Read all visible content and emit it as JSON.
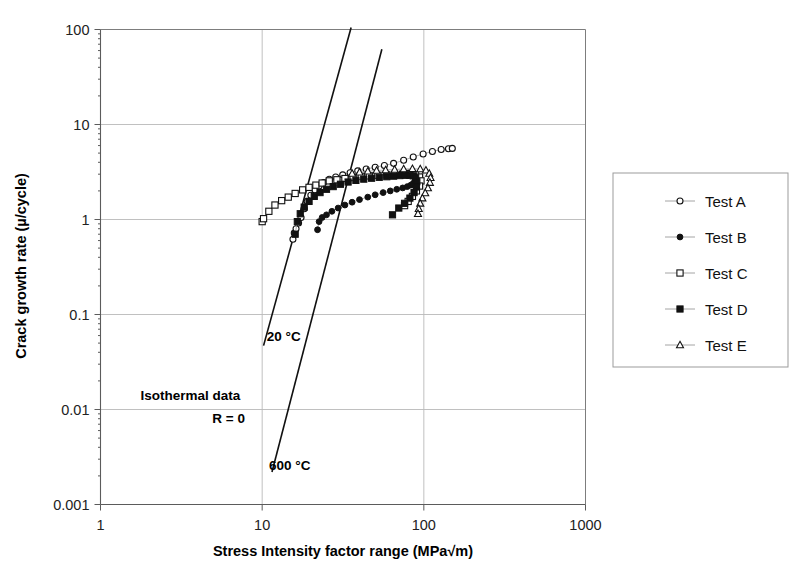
{
  "chart_data": {
    "type": "scatter",
    "title": "",
    "xlabel": "Stress Intensity factor range (MPa√m)",
    "ylabel": "Crack growth rate (µ/cycle)",
    "xscale": "log",
    "yscale": "log",
    "xlim": [
      1,
      1000
    ],
    "ylim": [
      0.001,
      100
    ],
    "xticks": [
      "1",
      "10",
      "100",
      "1000"
    ],
    "xtick_values": [
      1,
      10,
      100,
      1000
    ],
    "yticks": [
      "0.001",
      "0.01",
      "0.1",
      "1",
      "10",
      "100"
    ],
    "ytick_values": [
      0.001,
      0.01,
      0.1,
      1,
      10,
      100
    ],
    "grid": true,
    "legend_position": "right-outside",
    "annotations": [
      {
        "name": "line-label-20c",
        "text": "20 °C",
        "x": 13.6,
        "y": 0.052
      },
      {
        "name": "line-label-600c",
        "text": "600 °C",
        "x": 14.8,
        "y": 0.0023
      },
      {
        "name": "note-isothermal",
        "text": "Isothermal data",
        "x": 3.6,
        "y": 0.0125
      },
      {
        "name": "note-ratio",
        "text": "R = 0",
        "x": 6.2,
        "y": 0.0072
      }
    ],
    "reference_lines": [
      {
        "name": "ref-line-20c",
        "label": "20 °C",
        "x0": 10.2,
        "y0": 0.047,
        "x1": 35.5,
        "y1": 105
      },
      {
        "name": "ref-line-600c",
        "label": "600 °C",
        "x0": 11.5,
        "y0": 0.0022,
        "x1": 55.0,
        "y1": 62
      },
      "x0/y0 is lower end, x1/y1 upper end, straight in log-log"
    ],
    "series": [
      {
        "name": "Test A",
        "marker": "open-circle",
        "color": "#111111",
        "x": [
          15.5,
          15.8,
          16.2,
          16.8,
          17.4,
          18.2,
          19.0,
          20.0,
          21.2,
          22.5,
          24.0,
          26.0,
          28.5,
          31.5,
          35.0,
          39.0,
          44.0,
          50.0,
          57.0,
          65.0,
          75.0,
          86.0,
          99.0,
          113.0,
          128.0,
          142.0,
          150.0
        ],
        "y": [
          0.62,
          0.72,
          0.8,
          0.92,
          1.05,
          1.3,
          1.55,
          1.8,
          2.05,
          2.25,
          2.45,
          2.65,
          2.8,
          2.95,
          3.1,
          3.25,
          3.4,
          3.55,
          3.7,
          3.9,
          4.2,
          4.55,
          4.9,
          5.2,
          5.45,
          5.55,
          5.6
        ]
      },
      {
        "name": "Test B",
        "marker": "filled-circle",
        "color": "#111111",
        "x": [
          22.0,
          22.5,
          23.5,
          25.0,
          27.0,
          29.5,
          32.5,
          36.0,
          40.0,
          45.0,
          50.0,
          56.0,
          62.0,
          68.0,
          74.0,
          79.0,
          83.0,
          86.0,
          88.0,
          89.0,
          88.5,
          87.0,
          84.0,
          80.5,
          77.0
        ],
        "y": [
          0.78,
          0.95,
          1.05,
          1.12,
          1.22,
          1.32,
          1.42,
          1.52,
          1.62,
          1.72,
          1.82,
          1.92,
          2.0,
          2.08,
          2.15,
          2.22,
          2.3,
          2.4,
          2.52,
          2.65,
          2.8,
          2.95,
          3.05,
          3.1,
          3.1
        ]
      },
      {
        "name": "Test C",
        "marker": "open-square",
        "color": "#111111",
        "x": [
          10.0,
          10.2,
          11.0,
          12.0,
          13.2,
          14.5,
          16.0,
          17.8,
          19.5,
          21.5,
          23.5,
          26.0,
          29.0,
          32.5,
          36.5,
          41.0,
          46.0,
          52.0,
          59.0,
          66.0,
          74.0,
          82.0,
          89.0,
          94.0,
          96.0,
          94.0,
          90.0,
          85.0,
          80.0,
          76.0
        ],
        "y": [
          0.95,
          1.02,
          1.22,
          1.42,
          1.58,
          1.72,
          1.88,
          2.05,
          2.18,
          2.3,
          2.42,
          2.55,
          2.62,
          2.7,
          2.78,
          2.85,
          2.88,
          2.92,
          2.95,
          2.98,
          3.0,
          3.0,
          2.95,
          2.8,
          2.55,
          2.25,
          2.0,
          1.75,
          1.55,
          1.4
        ]
      },
      {
        "name": "Test D",
        "marker": "filled-square",
        "color": "#111111",
        "x": [
          16.0,
          16.5,
          17.2,
          18.2,
          19.5,
          21.0,
          22.8,
          25.0,
          27.5,
          30.5,
          34.0,
          38.0,
          42.5,
          47.5,
          53.0,
          59.0,
          65.0,
          71.0,
          77.0,
          82.0,
          86.0,
          89.0,
          90.5,
          90.0,
          87.0,
          82.0,
          76.0,
          70.0,
          64.0
        ],
        "y": [
          0.7,
          0.95,
          1.15,
          1.35,
          1.55,
          1.75,
          1.92,
          2.08,
          2.22,
          2.35,
          2.48,
          2.58,
          2.66,
          2.72,
          2.78,
          2.82,
          2.86,
          2.9,
          2.92,
          2.92,
          2.88,
          2.75,
          2.5,
          2.2,
          1.92,
          1.68,
          1.48,
          1.32,
          1.12
        ]
      },
      {
        "name": "Test E",
        "marker": "open-triangle",
        "color": "#111111",
        "x": [
          36.0,
          40.0,
          45.0,
          51.0,
          58.0,
          66.0,
          75.0,
          85.0,
          95.0,
          103.0,
          108.0,
          110.0,
          109.0,
          106.0,
          102.0,
          98.0,
          95.0,
          93.0,
          92.0
        ],
        "y": [
          3.05,
          3.15,
          3.22,
          3.28,
          3.32,
          3.36,
          3.4,
          3.42,
          3.4,
          3.3,
          3.05,
          2.75,
          2.45,
          2.15,
          1.9,
          1.68,
          1.48,
          1.3,
          1.15
        ]
      }
    ]
  },
  "legend": {
    "name": "chart-legend",
    "entries": [
      {
        "label": "Test A",
        "marker": "open-circle"
      },
      {
        "label": "Test B",
        "marker": "filled-circle"
      },
      {
        "label": "Test C",
        "marker": "open-square"
      },
      {
        "label": "Test D",
        "marker": "filled-square"
      },
      {
        "label": "Test E",
        "marker": "open-triangle"
      }
    ]
  },
  "colors": {
    "background": "#ffffff",
    "grid": "#b9b9b9",
    "frame": "#7d7d7d",
    "marker": "#111111",
    "reference_line": "#111111",
    "series_connector": "#9a9a9a"
  }
}
